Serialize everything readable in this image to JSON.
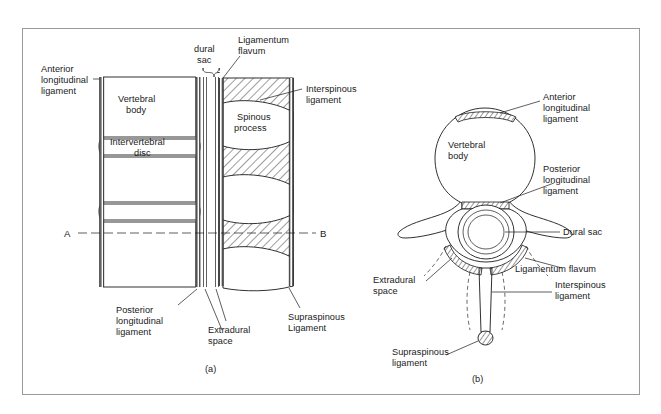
{
  "figure": {
    "background_color": "#ffffff",
    "frame_color": "#9a9a9a",
    "ink_color": "#1a1a1a",
    "panels": [
      {
        "id": "a",
        "caption": "(a)",
        "view": "sagittal-section",
        "labels": [
          "Anterior longitudinal ligament",
          "Vertebral body",
          "Intervertebral disc",
          "dural sac",
          "Ligamentum flavum",
          "Spinous process",
          "Interspinous ligament",
          "Posterior longitudinal ligament",
          "Extradural space",
          "Supraspinous Ligament"
        ]
      },
      {
        "id": "b",
        "caption": "(b)",
        "view": "transverse-section",
        "labels": [
          "Vertebral body",
          "Anterior longitudinal ligament",
          "Posterior longitudinal ligament",
          "Dural sac",
          "Ligamentum flavum",
          "Interspinous ligament",
          "Extradural space",
          "Supraspinous ligament"
        ]
      }
    ]
  },
  "panel_a": {
    "caption": "(a)",
    "section_marker_left": "A",
    "section_marker_right": "B",
    "labels": {
      "anterior_longitudinal_ligament": "Anterior\nlongitudinal\nligament",
      "anterior_longitudinal_ligament_l1": "Anterior",
      "anterior_longitudinal_ligament_l2": "longitudinal",
      "anterior_longitudinal_ligament_l3": "ligament",
      "vertebral_body_l1": "Vertebral",
      "vertebral_body_l2": "body",
      "intervertebral_disc_l1": "Intervertebral",
      "intervertebral_disc_l2": "disc",
      "dural_sac_l1": "dural",
      "dural_sac_l2": "sac",
      "ligamentum_flavum_l1": "Ligamentum",
      "ligamentum_flavum_l2": "flavum",
      "spinous_process_l1": "Spinous",
      "spinous_process_l2": "process",
      "interspinous_ligament_l1": "Interspinous",
      "interspinous_ligament_l2": "ligament",
      "posterior_longitudinal_ligament_l1": "Posterior",
      "posterior_longitudinal_ligament_l2": "longitudinal",
      "posterior_longitudinal_ligament_l3": "ligament",
      "extradural_space_l1": "Extradural",
      "extradural_space_l2": "space",
      "supraspinous_ligament_l1": "Supraspinous",
      "supraspinous_ligament_l2": "Ligament"
    }
  },
  "panel_b": {
    "caption": "(b)",
    "labels": {
      "vertebral_body_l1": "Vertebral",
      "vertebral_body_l2": "body",
      "anterior_longitudinal_ligament_l1": "Anterior",
      "anterior_longitudinal_ligament_l2": "longitudinal",
      "anterior_longitudinal_ligament_l3": "ligament",
      "posterior_longitudinal_ligament_l1": "Posterior",
      "posterior_longitudinal_ligament_l2": "longitudinal",
      "posterior_longitudinal_ligament_l3": "ligament",
      "dural_sac": "Dural sac",
      "ligamentum_flavum": "Ligamentum flavum",
      "interspinous_ligament_l1": "Interspinous",
      "interspinous_ligament_l2": "ligament",
      "extradural_space_l1": "Extradural",
      "extradural_space_l2": "space",
      "supraspinous_ligament_l1": "Supraspinous",
      "supraspinous_ligament_l2": "ligament"
    }
  }
}
